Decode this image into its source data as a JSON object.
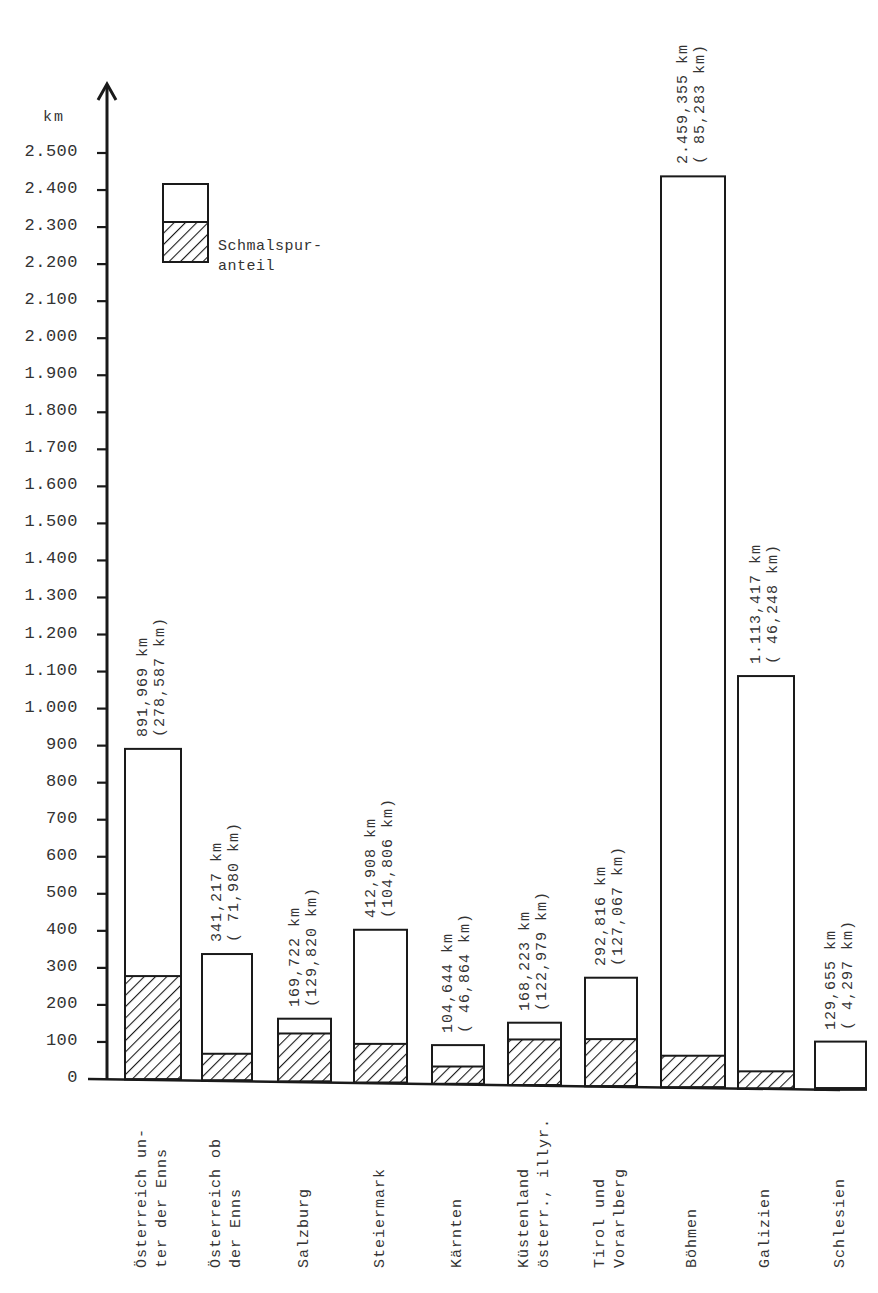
{
  "chart_data": {
    "type": "bar",
    "stacked": true,
    "title": "",
    "xlabel": "",
    "ylabel": "km",
    "ylim": [
      0,
      2500
    ],
    "yticks": [
      0,
      100,
      200,
      300,
      400,
      500,
      600,
      700,
      800,
      900,
      1000,
      1100,
      1200,
      1300,
      1400,
      1500,
      1600,
      1700,
      1800,
      1900,
      2000,
      2100,
      2200,
      2300,
      2400,
      2500
    ],
    "ytick_labels": [
      "0",
      "100",
      "200",
      "300",
      "400",
      "500",
      "600",
      "700",
      "800",
      "900",
      "1.000",
      "1.100",
      "1.200",
      "1.300",
      "1.400",
      "1.500",
      "1.600",
      "1.700",
      "1.800",
      "1.900",
      "2.000",
      "2.100",
      "2.200",
      "2.300",
      "2.400",
      "2.500"
    ],
    "grid": false,
    "legend": {
      "position": "upper-left",
      "entries": [
        {
          "name": "Gesamtlänge",
          "style": "white"
        },
        {
          "name": "Schmalspur-\nanteil",
          "style": "hatched"
        }
      ]
    },
    "categories": [
      "Österreich un-\nter der Enns",
      "Österreich ob\nder Enns",
      "Salzburg",
      "Steiermark",
      "Kärnten",
      "Küstenland\nösterr., illyr.",
      "Tirol und\nVorarlberg",
      "Böhmen",
      "Galizien",
      "Schlesien"
    ],
    "series": [
      {
        "name": "Gesamtlänge (km)",
        "values": [
          891.969,
          341.217,
          169.722,
          412.908,
          104.644,
          168.223,
          292.816,
          2459.355,
          1113.417,
          129.655
        ]
      },
      {
        "name": "Schmalspuranteil (km)",
        "values": [
          278.587,
          71.98,
          129.82,
          104.806,
          46.864,
          122.979,
          127.067,
          85.283,
          46.248,
          4.297
        ]
      }
    ],
    "data_labels": [
      {
        "total": "891,969 km",
        "narrow": "(278,587 km)"
      },
      {
        "total": "341,217 km",
        "narrow": "( 71,980 km)"
      },
      {
        "total": "169,722 km",
        "narrow": "(129,820 km)"
      },
      {
        "total": "412,908 km",
        "narrow": "(104,806 km)"
      },
      {
        "total": "104,644 km",
        "narrow": "( 46,864 km)"
      },
      {
        "total": "168,223 km",
        "narrow": "(122,979 km)"
      },
      {
        "total": "292,816 km",
        "narrow": "(127,067 km)"
      },
      {
        "total": "2.459,355 km",
        "narrow": "( 85,283 km)"
      },
      {
        "total": "1.113,417 km",
        "narrow": "( 46,248 km)"
      },
      {
        "total": "129,655 km",
        "narrow": "( 4,297 km)"
      }
    ]
  },
  "axis": {
    "unit": "km"
  },
  "legend": {
    "label": "Schmalspur-\nanteil"
  },
  "style": {
    "line_color": "#1a1a1a",
    "text_color": "#333333",
    "fill_color": "#ffffff"
  }
}
